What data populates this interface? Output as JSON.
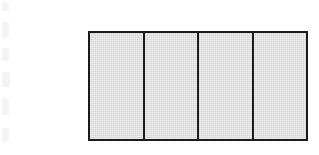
{
  "figure": {
    "shape_name": "divided-rectangle",
    "background_color": "#ffffff",
    "border_color": "#1b1b1b",
    "fill_color": "#d6d6d6",
    "fill_style": "halftone-gray",
    "border_width_px": 2,
    "divider_width_px": 2,
    "bounds": {
      "x": 88,
      "y": 31,
      "width": 220,
      "height": 110
    },
    "cell_count": 4,
    "cells": [
      {
        "index": 1,
        "label": "",
        "fill": "#d6d6d6"
      },
      {
        "index": 2,
        "label": "",
        "fill": "#d6d6d6"
      },
      {
        "index": 3,
        "label": "",
        "fill": "#d6d6d6"
      },
      {
        "index": 4,
        "label": "",
        "fill": "#d6d6d6"
      }
    ],
    "divider_positions_px": [
      144,
      197,
      252
    ]
  },
  "artifacts": {
    "name": "scan-streaks",
    "color": "#ededed",
    "streaks": [
      {
        "x": 2,
        "y": 2,
        "w": 7,
        "h": 9
      },
      {
        "x": 2,
        "y": 22,
        "w": 7,
        "h": 16
      },
      {
        "x": 2,
        "y": 48,
        "w": 7,
        "h": 13
      },
      {
        "x": 2,
        "y": 72,
        "w": 8,
        "h": 15
      },
      {
        "x": 2,
        "y": 98,
        "w": 7,
        "h": 17
      },
      {
        "x": 2,
        "y": 128,
        "w": 7,
        "h": 14
      }
    ]
  }
}
